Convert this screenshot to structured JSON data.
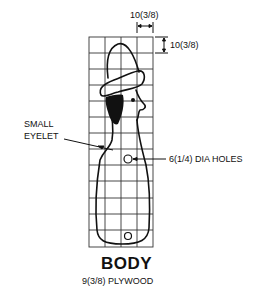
{
  "diagram": {
    "title": "BODY",
    "material": "9(3/8) PLYWOOD",
    "dimensions": {
      "grid_width_label": "10(3/8)",
      "grid_height_label": "10(3/8)"
    },
    "callouts": {
      "eyelet": [
        "SMALL",
        "EYELET"
      ],
      "holes": "6(1/4) DIA HOLES"
    },
    "grid": {
      "columns": 4,
      "rows": 13
    }
  }
}
